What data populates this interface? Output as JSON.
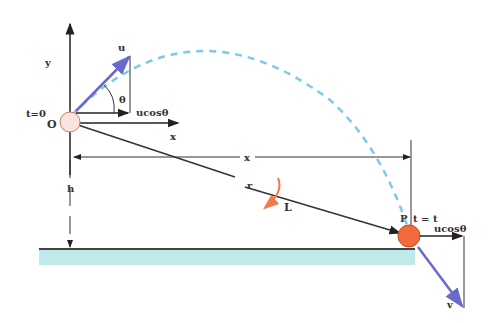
{
  "diagram": {
    "labels": {
      "y_axis": "y",
      "x_axis": "x",
      "origin": "O",
      "t0": "t=0",
      "initial_velocity": "u",
      "angle": "θ",
      "horizontal_component_start": "ucosθ",
      "range": "x",
      "height": "h",
      "position_vector": "r",
      "angular_momentum": "L",
      "point": "P",
      "t_end": "t = t",
      "horizontal_component_end": "ucosθ",
      "final_velocity": "v"
    },
    "colors": {
      "trajectory": "#7ec8e8",
      "velocity_vector": "#6a6acd",
      "ball_end": "#f26b3a",
      "ball_start": "#fbe3dc",
      "ground": "#bfe9ea",
      "line": "#333333",
      "L_arrow": "#f07a4a"
    }
  }
}
